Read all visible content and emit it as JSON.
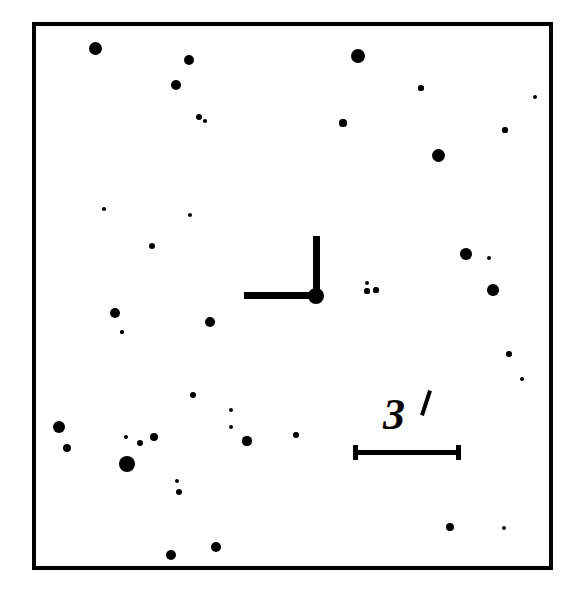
{
  "figure": {
    "kind": "astronomical-finding-chart",
    "background_color": "#ffffff",
    "ink_color": "#000000",
    "width": 579,
    "height": 597
  },
  "frame": {
    "left": 32,
    "top": 22,
    "width": 521,
    "height": 548,
    "border_width": 4,
    "border_color": "#000000"
  },
  "target_marker": {
    "type": "offset-crosshair",
    "center_x": 316,
    "center_y": 296,
    "dot_radius": 8,
    "vertical_tick": {
      "x": 313,
      "y": 236,
      "width": 7,
      "height": 57
    },
    "horizontal_tick": {
      "x": 244,
      "y": 292,
      "width": 66,
      "height": 7
    }
  },
  "scale_bar": {
    "label": "3",
    "unit_symbol": "′",
    "unit_name": "arcminute",
    "value_text": "3′",
    "bar_x": 353,
    "bar_y": 450,
    "bar_length": 108,
    "bar_thickness": 5,
    "cap_height": 15,
    "cap_width": 5,
    "label_x": 383,
    "label_y": 393,
    "label_size": 44,
    "prime_x": 424,
    "prime_y": 390,
    "prime_length": 26,
    "prime_thickness": 4
  },
  "chart_data": {
    "type": "scatter",
    "title": "",
    "xlabel": "",
    "ylabel": "",
    "grid": false,
    "legend": null,
    "xlim": [
      32,
      553
    ],
    "ylim": [
      22,
      570
    ],
    "point_color": "#000000",
    "point_shape": "filled-circle",
    "note": "Star field finding chart; point radius encodes apparent brightness (larger = brighter).",
    "stars": [
      {
        "x": 95,
        "y": 48,
        "r": 6.5
      },
      {
        "x": 189,
        "y": 60,
        "r": 5.0
      },
      {
        "x": 358,
        "y": 56,
        "r": 7.0
      },
      {
        "x": 176,
        "y": 85,
        "r": 5.0
      },
      {
        "x": 421,
        "y": 88,
        "r": 2.6
      },
      {
        "x": 535,
        "y": 97,
        "r": 2.0
      },
      {
        "x": 199,
        "y": 117,
        "r": 3.2
      },
      {
        "x": 205,
        "y": 121,
        "r": 1.8
      },
      {
        "x": 343,
        "y": 123,
        "r": 3.6
      },
      {
        "x": 505,
        "y": 130,
        "r": 2.6
      },
      {
        "x": 438,
        "y": 155,
        "r": 6.5
      },
      {
        "x": 104,
        "y": 209,
        "r": 2.0
      },
      {
        "x": 190,
        "y": 215,
        "r": 2.3
      },
      {
        "x": 152,
        "y": 246,
        "r": 3.0
      },
      {
        "x": 466,
        "y": 254,
        "r": 5.8
      },
      {
        "x": 489,
        "y": 258,
        "r": 2.0
      },
      {
        "x": 367,
        "y": 283,
        "r": 2.4
      },
      {
        "x": 367,
        "y": 291,
        "r": 2.6
      },
      {
        "x": 376,
        "y": 290,
        "r": 2.6
      },
      {
        "x": 493,
        "y": 290,
        "r": 5.8
      },
      {
        "x": 115,
        "y": 313,
        "r": 5.0
      },
      {
        "x": 210,
        "y": 322,
        "r": 5.2
      },
      {
        "x": 122,
        "y": 332,
        "r": 1.6
      },
      {
        "x": 509,
        "y": 354,
        "r": 2.8
      },
      {
        "x": 522,
        "y": 379,
        "r": 2.2
      },
      {
        "x": 193,
        "y": 395,
        "r": 3.2
      },
      {
        "x": 231,
        "y": 410,
        "r": 2.2
      },
      {
        "x": 59,
        "y": 427,
        "r": 6.0
      },
      {
        "x": 231,
        "y": 427,
        "r": 2.2
      },
      {
        "x": 296,
        "y": 435,
        "r": 2.8
      },
      {
        "x": 126,
        "y": 437,
        "r": 2.0
      },
      {
        "x": 154,
        "y": 437,
        "r": 4.0
      },
      {
        "x": 140,
        "y": 443,
        "r": 3.4
      },
      {
        "x": 247,
        "y": 441,
        "r": 4.6
      },
      {
        "x": 67,
        "y": 448,
        "r": 4.0
      },
      {
        "x": 127,
        "y": 464,
        "r": 8.0
      },
      {
        "x": 177,
        "y": 481,
        "r": 2.2
      },
      {
        "x": 179,
        "y": 492,
        "r": 3.0
      },
      {
        "x": 450,
        "y": 527,
        "r": 4.0
      },
      {
        "x": 504,
        "y": 528,
        "r": 2.4
      },
      {
        "x": 216,
        "y": 547,
        "r": 5.0
      },
      {
        "x": 171,
        "y": 555,
        "r": 5.2
      }
    ]
  }
}
